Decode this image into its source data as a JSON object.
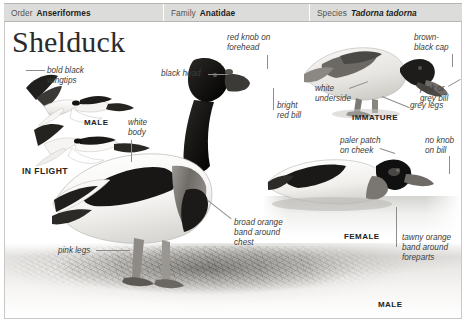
{
  "taxonomy": {
    "order_key": "Order",
    "order_value": "Anseriformes",
    "family_key": "Family",
    "family_value": "Anatidae",
    "species_key": "Species",
    "species_value": "Tadorna tadorna"
  },
  "title": "Shelduck",
  "captions": {
    "in_flight_male": "MALE",
    "in_flight": "IN FLIGHT",
    "immature": "IMMATURE",
    "female": "FEMALE",
    "male": "MALE"
  },
  "labels": {
    "bold_black_wingtips": "bold black\nwingtips",
    "white_body": "white\nbody",
    "black_head": "black head",
    "red_knob_on_forehead": "red knob on\nforehead",
    "bright_red_bill": "bright\nred bill",
    "white_underside": "white\nunderside",
    "brown_black_cap": "brown-\nblack cap",
    "pink_or_grey_bill": "pink or\ngrey bill",
    "grey_legs": "grey legs",
    "paler_patch_on_cheek": "paler patch\non cheek",
    "no_knob_on_bill": "no knob\non bill",
    "tawny_orange_band": "tawny orange\nband around\nforeparts",
    "broad_orange_band": "broad orange\nband around\nchest",
    "pink_legs": "pink legs"
  },
  "colors": {
    "header_bg": "#dcdcda",
    "header_text": "#4a4a48",
    "title_text": "#2b2b2b",
    "label_text": "#3d3d3b",
    "caption_text": "#242422",
    "leader_line": "#8d8d8b",
    "frame_border": "#c8c8c6",
    "page_bg": "#ffffff"
  }
}
